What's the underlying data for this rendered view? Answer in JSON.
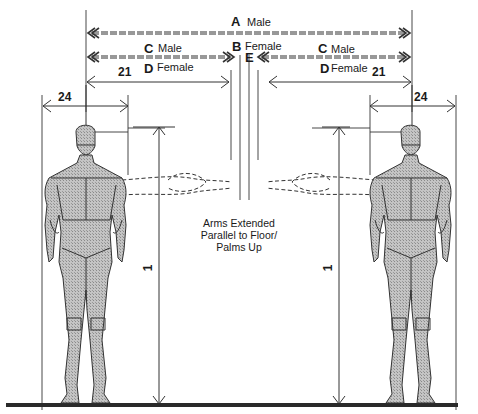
{
  "figure": {
    "dimensions": {
      "A": {
        "letter": "A",
        "label": "Male"
      },
      "B": {
        "letter": "B",
        "label": "Female"
      },
      "C_left": {
        "letter": "C",
        "label": "Male"
      },
      "C_right": {
        "letter": "C",
        "label": "Male"
      },
      "D_left": {
        "letter": "D",
        "label": "Female"
      },
      "D_right": {
        "letter": "D",
        "label": "Female"
      },
      "E": {
        "letter": "E"
      },
      "span_left": "21",
      "span_right": "21",
      "shoulder_left": "24",
      "shoulder_right": "24",
      "height_left": "1",
      "height_right": "1"
    },
    "annotation": {
      "line1": "Arms Extended",
      "line2": "Parallel to Floor/",
      "line3": "Palms Up"
    },
    "colors": {
      "ink": "#1a1a1a",
      "body_fill": "#b8b8b8",
      "floor": "#2a2a2a"
    }
  }
}
